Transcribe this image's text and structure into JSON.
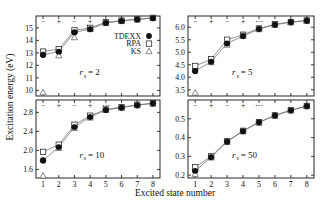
{
  "figure": {
    "xlabel": "Excited state number",
    "ylabel": "Excitation energy (eV)",
    "legend": [
      {
        "label": "TDEXX",
        "marker": "filled-circle"
      },
      {
        "label": "RPA",
        "marker": "open-square"
      },
      {
        "label": "KS",
        "marker": "open-triangle"
      }
    ],
    "parity_row": [
      "−",
      "+",
      "−",
      "+",
      "⋯"
    ]
  },
  "chart_data": [
    {
      "type": "scatter",
      "title": "r_s = 2",
      "panel_label": "r",
      "panel_sub": "s",
      "panel_eq": "=  2",
      "xlabel": "Excited state number",
      "ylabel": "Excitation energy (eV)",
      "x": [
        1,
        2,
        3,
        4,
        5,
        6,
        7,
        8
      ],
      "xlim": [
        0.55,
        8.45
      ],
      "ylim": [
        9.55,
        15.95
      ],
      "yticks": [
        10,
        11,
        12,
        13,
        14,
        15
      ],
      "ytick_labels": [
        "10",
        "11",
        "12",
        "13",
        "14",
        "15"
      ],
      "xticks": [
        1,
        2,
        3,
        4,
        5,
        6,
        7,
        8
      ],
      "grid": false,
      "series": [
        {
          "name": "TDEXX",
          "marker": "filled-circle",
          "values": [
            12.85,
            13.1,
            14.65,
            14.9,
            15.4,
            15.55,
            15.68,
            15.78
          ]
        },
        {
          "name": "RPA",
          "marker": "open-square",
          "values": [
            13.1,
            13.3,
            14.8,
            15.0,
            15.45,
            15.58,
            15.7,
            15.8
          ]
        },
        {
          "name": "KS",
          "marker": "open-triangle",
          "values": [
            9.85,
            12.8,
            14.25,
            14.9,
            15.38,
            15.55,
            15.68,
            15.78
          ]
        }
      ]
    },
    {
      "type": "scatter",
      "title": "r_s = 5",
      "panel_label": "r",
      "panel_sub": "s",
      "panel_eq": "=  5",
      "xlabel": "Excited state number",
      "ylabel": "Excitation energy (eV)",
      "x": [
        1,
        2,
        3,
        4,
        5,
        6,
        7,
        8
      ],
      "xlim": [
        0.55,
        8.45
      ],
      "ylim": [
        3.25,
        6.45
      ],
      "yticks": [
        3.5,
        4.0,
        4.5,
        5.0,
        5.5,
        6.0
      ],
      "ytick_labels": [
        "3.5",
        "4.0",
        "4.5",
        "5.0",
        "5.5",
        "6.0"
      ],
      "xticks": [
        1,
        2,
        3,
        4,
        5,
        6,
        7,
        8
      ],
      "grid": false,
      "series": [
        {
          "name": "TDEXX",
          "marker": "filled-circle",
          "values": [
            4.25,
            4.62,
            5.35,
            5.65,
            5.93,
            6.1,
            6.2,
            6.26
          ]
        },
        {
          "name": "RPA",
          "marker": "open-square",
          "values": [
            4.45,
            4.72,
            5.5,
            5.7,
            5.95,
            6.12,
            6.21,
            6.27
          ]
        },
        {
          "name": "KS",
          "marker": "open-triangle",
          "values": [
            3.38,
            4.6,
            5.3,
            5.65,
            5.92,
            6.1,
            6.2,
            6.26
          ]
        }
      ]
    },
    {
      "type": "scatter",
      "title": "r_s = 10",
      "panel_label": "r",
      "panel_sub": "s",
      "panel_eq": "=  10",
      "xlabel": "Excited state number",
      "ylabel": "Excitation energy (eV)",
      "x": [
        1,
        2,
        3,
        4,
        5,
        6,
        7,
        8
      ],
      "xlim": [
        0.55,
        8.45
      ],
      "ylim": [
        1.42,
        3.06
      ],
      "yticks": [
        1.6,
        2.0,
        2.4,
        2.8
      ],
      "ytick_labels": [
        "1.6",
        "2.0",
        "2.4",
        "2.8"
      ],
      "xticks": [
        1,
        2,
        3,
        4,
        5,
        6,
        7,
        8
      ],
      "grid": false,
      "series": [
        {
          "name": "TDEXX",
          "marker": "filled-circle",
          "values": [
            1.79,
            2.07,
            2.49,
            2.7,
            2.85,
            2.9,
            2.95,
            2.99
          ]
        },
        {
          "name": "RPA",
          "marker": "open-square",
          "values": [
            1.97,
            2.12,
            2.54,
            2.73,
            2.86,
            2.91,
            2.96,
            2.99
          ]
        },
        {
          "name": "KS",
          "marker": "open-triangle",
          "values": [
            1.47,
            2.05,
            2.47,
            2.69,
            2.85,
            2.9,
            2.95,
            2.99
          ]
        }
      ]
    },
    {
      "type": "scatter",
      "title": "r_s = 50",
      "panel_label": "r",
      "panel_sub": "s",
      "panel_eq": "=  50",
      "xlabel": "Excited state number",
      "ylabel": "Excitation energy (eV)",
      "x": [
        1,
        2,
        3,
        4,
        5,
        6,
        7,
        8
      ],
      "xlim": [
        0.55,
        8.45
      ],
      "ylim": [
        0.185,
        0.6
      ],
      "yticks": [
        0.2,
        0.3,
        0.4,
        0.5
      ],
      "ytick_labels": [
        "0.2",
        "0.3",
        "0.4",
        "0.5"
      ],
      "xticks": [
        1,
        2,
        3,
        4,
        5,
        6,
        7,
        8
      ],
      "grid": false,
      "series": [
        {
          "name": "TDEXX",
          "marker": "filled-circle",
          "values": [
            0.223,
            0.296,
            0.378,
            0.434,
            0.481,
            0.517,
            0.545,
            0.567
          ]
        },
        {
          "name": "RPA",
          "marker": "open-square",
          "values": [
            0.243,
            0.3,
            0.38,
            0.436,
            0.482,
            0.518,
            0.546,
            0.568
          ]
        },
        {
          "name": "KS",
          "marker": "open-triangle",
          "values": [
            0.207,
            0.294,
            0.377,
            0.433,
            0.48,
            0.516,
            0.545,
            0.567
          ]
        }
      ]
    }
  ]
}
